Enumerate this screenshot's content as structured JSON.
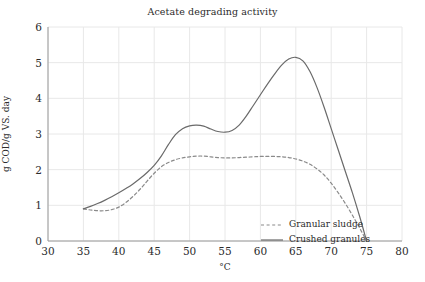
{
  "chart_data": {
    "type": "line",
    "title": "Acetate degrading activity",
    "xlabel": "°C",
    "ylabel": "g COD/g VS. day",
    "xlim": [
      30,
      80
    ],
    "ylim": [
      0,
      6
    ],
    "xticks": [
      30,
      35,
      40,
      45,
      50,
      55,
      60,
      65,
      70,
      75,
      80
    ],
    "yticks": [
      0,
      1,
      2,
      3,
      4,
      5,
      6
    ],
    "grid": true,
    "legend_position": "inside lower-center-right",
    "series": [
      {
        "name": "Granular sludge",
        "style": "dashed",
        "color": "#8a8a8a",
        "x": [
          35,
          36,
          37,
          38,
          39,
          40,
          41,
          42,
          43,
          44,
          45,
          46,
          47,
          48,
          49,
          50,
          51,
          52,
          53,
          54,
          55,
          56,
          57,
          58,
          59,
          60,
          61,
          62,
          63,
          64,
          65,
          66,
          67,
          68,
          69,
          70,
          71,
          72,
          73,
          74,
          75
        ],
        "y": [
          0.9,
          0.87,
          0.85,
          0.85,
          0.88,
          0.95,
          1.08,
          1.25,
          1.45,
          1.68,
          1.9,
          2.08,
          2.2,
          2.28,
          2.33,
          2.36,
          2.38,
          2.38,
          2.36,
          2.34,
          2.33,
          2.33,
          2.34,
          2.35,
          2.36,
          2.37,
          2.37,
          2.37,
          2.36,
          2.34,
          2.3,
          2.24,
          2.15,
          2.02,
          1.85,
          1.62,
          1.35,
          1.05,
          0.72,
          0.37,
          0.0
        ]
      },
      {
        "name": "Crushed granules",
        "style": "solid",
        "color": "#6a6a6a",
        "x": [
          35,
          36,
          37,
          38,
          39,
          40,
          41,
          42,
          43,
          44,
          45,
          46,
          47,
          48,
          49,
          50,
          51,
          52,
          53,
          54,
          55,
          56,
          57,
          58,
          59,
          60,
          61,
          62,
          63,
          64,
          65,
          66,
          67,
          68,
          69,
          70,
          71,
          72,
          73,
          74,
          75
        ],
        "y": [
          0.9,
          0.97,
          1.05,
          1.14,
          1.24,
          1.35,
          1.47,
          1.6,
          1.75,
          1.92,
          2.12,
          2.38,
          2.7,
          2.98,
          3.15,
          3.23,
          3.25,
          3.22,
          3.14,
          3.07,
          3.05,
          3.1,
          3.25,
          3.5,
          3.8,
          4.1,
          4.4,
          4.68,
          4.93,
          5.1,
          5.15,
          5.05,
          4.75,
          4.3,
          3.75,
          3.15,
          2.55,
          1.95,
          1.35,
          0.7,
          0.0
        ]
      }
    ]
  },
  "axis": {
    "ytick_labels": [
      "0",
      "1",
      "2",
      "3",
      "4",
      "5",
      "6"
    ],
    "xtick_labels": [
      "30",
      "35",
      "40",
      "45",
      "50",
      "55",
      "60",
      "65",
      "70",
      "75",
      "80"
    ]
  },
  "legend": {
    "items": [
      {
        "label": "Granular sludge",
        "style": "dashed"
      },
      {
        "label": "Crushed granules",
        "style": "solid"
      }
    ]
  },
  "colors": {
    "grid": "#e8e8e8",
    "axis": "#9a9a9a",
    "text": "#2b2b2b",
    "series_dashed": "#8a8a8a",
    "series_solid": "#6a6a6a"
  }
}
